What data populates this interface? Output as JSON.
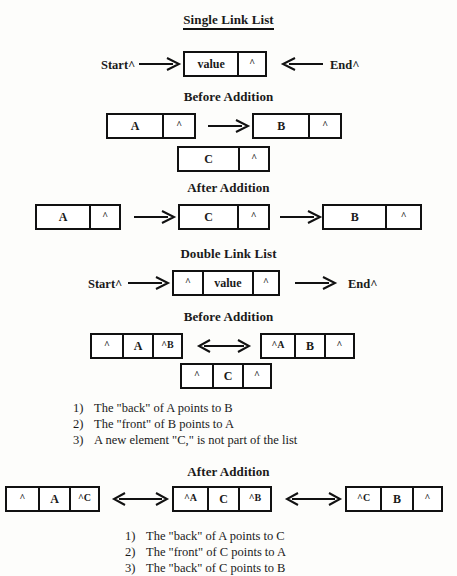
{
  "document": {
    "title": "Single and Double Link List diagram"
  },
  "sections": {
    "single": {
      "title": "Single Link List",
      "start_label": "Start^",
      "end_label": "End^",
      "value_label": "value",
      "pointer": "^",
      "before_title": "Before Addition",
      "after_title": "After Addition",
      "node_a": "A",
      "node_b": "B",
      "node_c": "C"
    },
    "double": {
      "title": "Double Link List",
      "start_label": "Start^",
      "end_label": "End^",
      "value_label": "value",
      "pointer": "^",
      "before_title": "Before Addition",
      "after_title": "After Addition",
      "before": {
        "node1": {
          "front": "^",
          "value": "A",
          "back": "^B"
        },
        "node2": {
          "front": "^A",
          "value": "B",
          "back": "^"
        },
        "node3": {
          "front": "^",
          "value": "C",
          "back": "^"
        }
      },
      "after": {
        "node1": {
          "front": "^",
          "value": "A",
          "back": "^C"
        },
        "node2": {
          "front": "^A",
          "value": "C",
          "back": "^B"
        },
        "node3": {
          "front": "^C",
          "value": "B",
          "back": "^"
        }
      },
      "before_notes": [
        {
          "num": "1)",
          "text": "The \"back\" of A points to B"
        },
        {
          "num": "2)",
          "text": "The \"front\" of B points to A"
        },
        {
          "num": "3)",
          "text": "A new element \"C,\" is not part of the list"
        }
      ],
      "after_notes": [
        {
          "num": "1)",
          "text": "The \"back\" of A points to C"
        },
        {
          "num": "2)",
          "text": "The \"front\" of C points to A"
        },
        {
          "num": "3)",
          "text": "The \"back\" of C points to B"
        }
      ]
    }
  },
  "colors": {
    "ink": "#111111",
    "paper": "#fdfdfb"
  }
}
